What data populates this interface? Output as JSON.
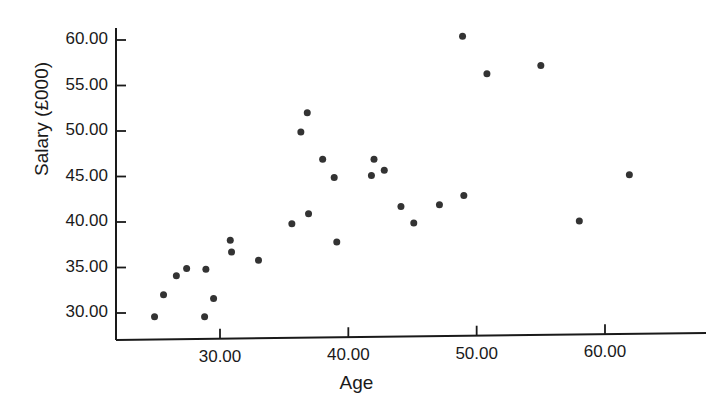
{
  "chart_data": {
    "type": "scatter",
    "title": "",
    "xlabel": "Age",
    "ylabel": "Salary (£000)",
    "xlim": [
      24.0,
      65.5
    ],
    "ylim": [
      28.5,
      61.5
    ],
    "xticks": [
      30.0,
      40.0,
      50.0,
      60.0
    ],
    "xtick_labels": [
      "30.00",
      "40.00",
      "50.00",
      "60.00"
    ],
    "yticks": [
      30.0,
      35.0,
      40.0,
      45.0,
      50.0,
      55.0,
      60.0
    ],
    "ytick_labels": [
      "30.00",
      "35.00",
      "40.00",
      "45.00",
      "50.00",
      "55.00",
      "60.00"
    ],
    "grid": false,
    "legend": false,
    "marker": "circle",
    "marker_color": "#333333",
    "marker_size": 7,
    "axis_color": "#1a1a1a",
    "background": "#ffffff",
    "points": [
      {
        "x": 24.9,
        "y": 29.6
      },
      {
        "x": 25.6,
        "y": 32.0
      },
      {
        "x": 26.6,
        "y": 34.1
      },
      {
        "x": 27.4,
        "y": 34.9
      },
      {
        "x": 28.9,
        "y": 34.8
      },
      {
        "x": 28.8,
        "y": 29.6
      },
      {
        "x": 29.5,
        "y": 31.6
      },
      {
        "x": 30.8,
        "y": 38.0
      },
      {
        "x": 30.9,
        "y": 36.7
      },
      {
        "x": 33.0,
        "y": 35.8
      },
      {
        "x": 35.6,
        "y": 39.8
      },
      {
        "x": 36.3,
        "y": 49.9
      },
      {
        "x": 36.8,
        "y": 52.0
      },
      {
        "x": 36.9,
        "y": 40.9
      },
      {
        "x": 38.0,
        "y": 46.9
      },
      {
        "x": 38.9,
        "y": 44.9
      },
      {
        "x": 39.1,
        "y": 37.8
      },
      {
        "x": 41.8,
        "y": 45.1
      },
      {
        "x": 42.0,
        "y": 46.9
      },
      {
        "x": 42.8,
        "y": 45.7
      },
      {
        "x": 44.1,
        "y": 41.7
      },
      {
        "x": 45.1,
        "y": 39.9
      },
      {
        "x": 47.1,
        "y": 41.9
      },
      {
        "x": 48.9,
        "y": 60.4
      },
      {
        "x": 49.0,
        "y": 42.9
      },
      {
        "x": 50.8,
        "y": 56.3
      },
      {
        "x": 55.0,
        "y": 57.2
      },
      {
        "x": 58.0,
        "y": 40.1
      },
      {
        "x": 61.9,
        "y": 45.2
      }
    ]
  }
}
